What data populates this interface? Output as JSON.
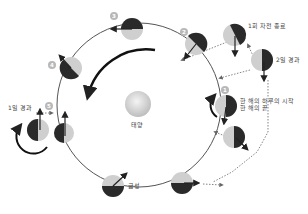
{
  "diagram": {
    "title": "",
    "center_body": {
      "label": "태양",
      "color": "#d6d6d6"
    },
    "planet_label": "금성",
    "colors": {
      "orbit": "#555555",
      "lit": "#cfcfcf",
      "dark": "#2a2a2a",
      "arrow": "#222222",
      "dotted": "#777777",
      "marker": "#b8b8b8"
    },
    "positions": [
      {
        "id": "1",
        "marker": "1",
        "note_line1": "한 해의 하루의 시작",
        "note_line2": "한 해의 끝"
      },
      {
        "id": "2",
        "marker": "2"
      },
      {
        "id": "3",
        "marker": "3"
      },
      {
        "id": "4",
        "marker": "4"
      },
      {
        "id": "5",
        "marker": "5",
        "note": "1일 경과"
      }
    ],
    "side_notes": {
      "rotation_complete": "1회 자전 종료",
      "two_days": "2일 경과"
    }
  }
}
